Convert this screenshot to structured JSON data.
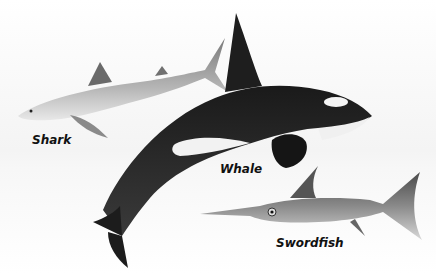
{
  "illustration": {
    "animals": [
      {
        "id": "shark",
        "label": "Shark"
      },
      {
        "id": "whale",
        "label": "Whale"
      },
      {
        "id": "swordfish",
        "label": "Swordfish"
      }
    ]
  }
}
